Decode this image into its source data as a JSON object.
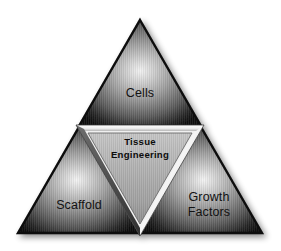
{
  "figure": {
    "background_color": "#ffffff",
    "style": "metallic grayscale beveled Sierpinski triangle"
  },
  "nodes": {
    "top": {
      "label": "Cells",
      "position": "top",
      "text_color": "#121212"
    },
    "bottom_left": {
      "label": "Scaffold",
      "position": "bottom-left",
      "text_color": "#121212"
    },
    "bottom_right": {
      "label": "Growth\nFactors",
      "line1": "Growth",
      "line2": "Factors",
      "position": "bottom-right",
      "text_color": "#121212"
    },
    "center": {
      "label": "Tissue\nEngineering",
      "line1": "Tissue",
      "line2": "Engineering",
      "position": "center-inverted",
      "text_color": "#0c0c0c"
    }
  },
  "colors": {
    "background": "#ffffff",
    "metal_light": "#e8e8e8",
    "metal_mid": "#9a9a9a",
    "metal_dark": "#2a2a2a",
    "metal_edge": "#0a0a0a",
    "bevel_highlight": "#fdfdfd",
    "center_fill": "#b2b2b2",
    "shadow": "#b9b9b9"
  },
  "geometry": {
    "apex": [
      140,
      20
    ],
    "base_left": [
      18,
      233
    ],
    "base_right": [
      262,
      233
    ],
    "mid_left": [
      79,
      126
    ],
    "mid_right": [
      201,
      126
    ],
    "mid_bottom": [
      140,
      233
    ]
  }
}
